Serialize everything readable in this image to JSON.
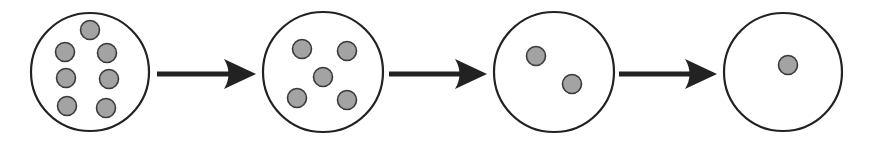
{
  "diagram": {
    "type": "sequence",
    "colors": {
      "background": "#ffffff",
      "circle_stroke": "#222222",
      "circle_fill": "#ffffff",
      "particle_fill": "#a3a3a3",
      "particle_stroke": "#3a3a3a",
      "arrow": "#222222"
    },
    "stages": [
      {
        "id": "stage-1",
        "particle_count": 7,
        "circle": {
          "cx": 90,
          "cy": 72,
          "r": 59
        },
        "particles": [
          {
            "cx": 90,
            "cy": 30
          },
          {
            "cx": 65,
            "cy": 52
          },
          {
            "cx": 107,
            "cy": 53
          },
          {
            "cx": 66,
            "cy": 78
          },
          {
            "cx": 109,
            "cy": 79
          },
          {
            "cx": 67,
            "cy": 106
          },
          {
            "cx": 106,
            "cy": 108
          }
        ]
      },
      {
        "id": "stage-2",
        "particle_count": 5,
        "circle": {
          "cx": 323,
          "cy": 72,
          "r": 60
        },
        "particles": [
          {
            "cx": 302,
            "cy": 49
          },
          {
            "cx": 347,
            "cy": 51
          },
          {
            "cx": 323,
            "cy": 77
          },
          {
            "cx": 297,
            "cy": 98
          },
          {
            "cx": 347,
            "cy": 100
          }
        ]
      },
      {
        "id": "stage-3",
        "particle_count": 2,
        "circle": {
          "cx": 554,
          "cy": 72,
          "r": 60
        },
        "particles": [
          {
            "cx": 536,
            "cy": 56
          },
          {
            "cx": 572,
            "cy": 84
          }
        ]
      },
      {
        "id": "stage-4",
        "particle_count": 1,
        "circle": {
          "cx": 783,
          "cy": 72,
          "r": 59
        },
        "particles": [
          {
            "cx": 788,
            "cy": 65
          }
        ]
      }
    ],
    "particle_radius": 9.5,
    "arrows": [
      {
        "from": "stage-1",
        "to": "stage-2",
        "x1": 157,
        "x2": 256,
        "y": 74
      },
      {
        "from": "stage-2",
        "to": "stage-3",
        "x1": 389,
        "x2": 487,
        "y": 74
      },
      {
        "from": "stage-3",
        "to": "stage-4",
        "x1": 619,
        "x2": 717,
        "y": 74
      }
    ]
  }
}
